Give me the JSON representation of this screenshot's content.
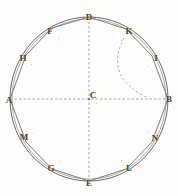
{
  "figure": {
    "type": "geometry-diagram",
    "width": 180,
    "height": 196,
    "background_color": "#fdfdfc",
    "stroke_color": "#6b6862",
    "dashed_color": "#8d8a84",
    "label_color": "#3b3a38"
  },
  "circle": {
    "name": "outer-circle",
    "center": {
      "x": 89,
      "y": 99,
      "label": "C"
    },
    "radius_x": 79,
    "radius_y": 82,
    "inner_radius_x": 77,
    "inner_radius_y": 80
  },
  "axes": {
    "horizontal": {
      "name": "diameter-AB",
      "from_label": "A",
      "to_label": "B",
      "x1": 10,
      "y1": 99,
      "x2": 168,
      "y2": 99,
      "style": "dashed"
    },
    "vertical": {
      "name": "diameter-DE",
      "from_label": "D",
      "to_label": "E",
      "x1": 89,
      "y1": 17,
      "x2": 89,
      "y2": 181,
      "style": "dashed"
    }
  },
  "dashed_arc": {
    "name": "construction-arc-K-to-axis",
    "from_label": "K",
    "to_label": "B-side of AB",
    "start": {
      "x": 124,
      "y": 38
    },
    "control": {
      "x": 104,
      "y": 76
    },
    "end": {
      "x": 146,
      "y": 97
    },
    "style": "dashed",
    "description": "Arc sweeping from vertex K inward past C toward the horizontal axis"
  },
  "polygon": {
    "name": "inscribed-polygon",
    "sides": 12,
    "vertex_order": [
      "A",
      "H",
      "F",
      "D",
      "K",
      "I",
      "B",
      "N",
      "L",
      "E",
      "G",
      "M"
    ],
    "points": "10,99 26,55 52,28 89,17 126,29 152,56 168,99 152,142 126,169 89,181 52,169 26,142"
  },
  "vertices": [
    {
      "id": "A",
      "label": "A",
      "x": 9,
      "y": 100,
      "anchor": "left"
    },
    {
      "id": "H",
      "label": "H",
      "x": 23,
      "y": 58,
      "anchor": "upper-left"
    },
    {
      "id": "F",
      "label": "F",
      "x": 50,
      "y": 31,
      "anchor": "top-left"
    },
    {
      "id": "D",
      "label": "D",
      "x": 89,
      "y": 17,
      "anchor": "top"
    },
    {
      "id": "K",
      "label": "K",
      "x": 129,
      "y": 31,
      "anchor": "top-right"
    },
    {
      "id": "I",
      "label": "I",
      "x": 156,
      "y": 58,
      "anchor": "upper-right"
    },
    {
      "id": "B",
      "label": "B",
      "x": 169,
      "y": 99,
      "anchor": "right"
    },
    {
      "id": "N",
      "label": "N",
      "x": 155,
      "y": 138,
      "anchor": "lower-right"
    },
    {
      "id": "L",
      "label": "L",
      "x": 129,
      "y": 168,
      "anchor": "bottom-right"
    },
    {
      "id": "E",
      "label": "E",
      "x": 89,
      "y": 183,
      "anchor": "bottom"
    },
    {
      "id": "G",
      "label": "G",
      "x": 51,
      "y": 168,
      "anchor": "bottom-left"
    },
    {
      "id": "M",
      "label": "M",
      "x": 24,
      "y": 137,
      "anchor": "lower-left"
    },
    {
      "id": "C",
      "label": "C",
      "x": 93,
      "y": 95,
      "anchor": "center"
    }
  ],
  "specks": [
    {
      "x": 58,
      "y": 38
    },
    {
      "x": 31,
      "y": 64
    },
    {
      "x": 121,
      "y": 40
    },
    {
      "x": 148,
      "y": 66
    },
    {
      "x": 148,
      "y": 131
    },
    {
      "x": 121,
      "y": 160
    },
    {
      "x": 59,
      "y": 161
    },
    {
      "x": 33,
      "y": 133
    },
    {
      "x": 96,
      "y": 103
    }
  ]
}
